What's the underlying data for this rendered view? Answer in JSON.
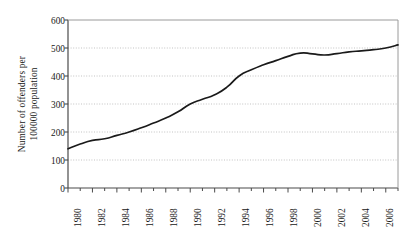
{
  "chart_data": {
    "type": "line",
    "title": "",
    "subtitle": "",
    "xlabel": "",
    "ylabel": "Number of offenders per 100000 population",
    "ylabel_lines": [
      "Number of offenders per",
      "100000 population"
    ],
    "x": [
      1980,
      1981,
      1982,
      1983,
      1984,
      1985,
      1986,
      1987,
      1988,
      1989,
      1990,
      1991,
      1992,
      1993,
      1994,
      1995,
      1996,
      1997,
      1998,
      1999,
      2000,
      2001,
      2002,
      2003,
      2004,
      2005,
      2006,
      2007
    ],
    "values": [
      140,
      157,
      170,
      176,
      188,
      200,
      215,
      232,
      250,
      272,
      300,
      317,
      333,
      360,
      400,
      422,
      440,
      455,
      470,
      482,
      479,
      475,
      480,
      486,
      490,
      494,
      500,
      511
    ],
    "series": [
      {
        "name": "Number of offenders per 100000 population",
        "values": [
          140,
          157,
          170,
          176,
          188,
          200,
          215,
          232,
          250,
          272,
          300,
          317,
          333,
          360,
          400,
          422,
          440,
          455,
          470,
          482,
          479,
          475,
          480,
          486,
          490,
          494,
          500,
          511
        ]
      }
    ],
    "ytick_labels": [
      "600",
      "500",
      "400",
      "300",
      "200",
      "100",
      "0"
    ],
    "ytick_values": [
      600,
      500,
      400,
      300,
      200,
      100,
      0
    ],
    "xtick_labels": [
      "1980",
      "1982",
      "1984",
      "1986",
      "1988",
      "1990",
      "1992",
      "1994",
      "1996",
      "1998",
      "2000",
      "2002",
      "2004",
      "2006"
    ],
    "xtick_values": [
      1980,
      1982,
      1984,
      1986,
      1988,
      1990,
      1992,
      1994,
      1996,
      1998,
      2000,
      2002,
      2004,
      2006
    ],
    "xlim": [
      1980,
      2007
    ],
    "ylim": [
      0,
      600
    ],
    "grid": true,
    "grid_style": "dotted-horizontal",
    "legend": false,
    "legend_position": "none",
    "line_color": "#1a1a1a",
    "grid_color": "#b4b4b4",
    "axis_color": "#4a4a4a",
    "background_color": "#ffffff"
  }
}
